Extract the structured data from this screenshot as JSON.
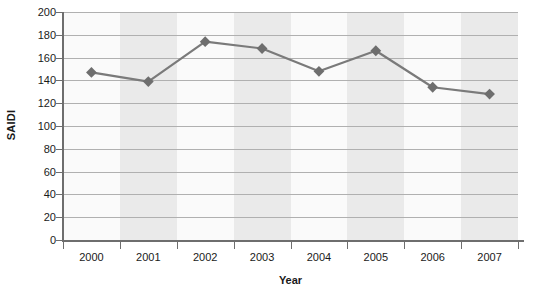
{
  "chart_data": {
    "type": "line",
    "title": "",
    "xlabel": "Year",
    "ylabel": "SAIDI",
    "categories": [
      "2000",
      "2001",
      "2002",
      "2003",
      "2004",
      "2005",
      "2006",
      "2007"
    ],
    "x": [
      2000,
      2001,
      2002,
      2003,
      2004,
      2005,
      2006,
      2007
    ],
    "values": [
      147,
      139,
      174,
      168,
      148,
      166,
      134,
      128
    ],
    "series": [
      {
        "name": "SAIDI",
        "values": [
          147,
          139,
          174,
          168,
          148,
          166,
          134,
          128
        ]
      }
    ],
    "ylim": [
      0,
      200
    ],
    "y_ticks": [
      0,
      20,
      40,
      60,
      80,
      100,
      120,
      140,
      160,
      180,
      200
    ],
    "y_tick_labels": [
      "0",
      "20",
      "40",
      "60",
      "80",
      "100",
      "120",
      "140",
      "160",
      "180",
      "200"
    ],
    "grid": true,
    "grid_axis": "y",
    "legend": false,
    "legend_position": "none",
    "marker": "diamond",
    "alternating_band_shading": true,
    "colors": {
      "line": "#7a7a7a",
      "marker": "#6e6e6e",
      "gridline": "#b0b0b0",
      "axis": "#6e6e6e",
      "band_shaded": "#eaeaea",
      "band_plain": "#fafafa",
      "text": "#1a1a1a",
      "background": "#ffffff"
    }
  }
}
